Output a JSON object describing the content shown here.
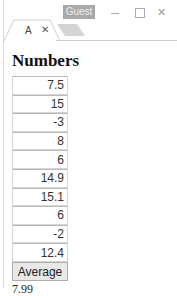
{
  "window": {
    "profile_badge": "Guest",
    "controls": {
      "minimize_icon": "minimize-icon",
      "maximize_icon": "maximize-icon",
      "close_glyph": "✕"
    },
    "tabs": [
      {
        "title": "A",
        "close_glyph": "✕",
        "active": true
      }
    ],
    "new_tab_icon": "new-tab-icon"
  },
  "page": {
    "heading": "Numbers",
    "inputs": [
      "7.5",
      "15",
      "-3",
      "8",
      "6",
      "14.9",
      "15.1",
      "6",
      "-2",
      "12.4"
    ],
    "button_label": "Average",
    "result": "7.99"
  }
}
